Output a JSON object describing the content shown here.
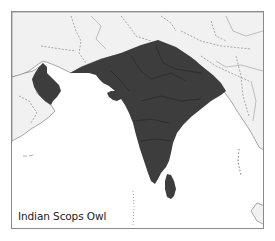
{
  "map": {
    "title": "Indian Scops Owl",
    "colors": {
      "range_fill": "#3d3d3d",
      "land": "#f1f1f1",
      "sea": "#ffffff",
      "border_lines": "#777777",
      "frame": "#8a8a8a"
    },
    "range_regions": [
      "Oman",
      "Indian subcontinent",
      "Sri Lanka"
    ]
  }
}
